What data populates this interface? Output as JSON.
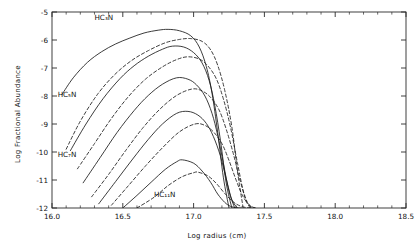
{
  "figure": {
    "xlabel": "Log radius (cm)",
    "ylabel": "Log Fractional Abundance",
    "line_color": "#1a1a1a",
    "frame_color": "#2b2b2b",
    "background": "#ffffff"
  },
  "annotations": [
    {
      "name": "label-hc3n",
      "text": "HC₃N",
      "x": 16.3,
      "y": -5.3
    },
    {
      "name": "label-hc5n",
      "text": "HC₅N",
      "x": 16.04,
      "y": -8.02
    },
    {
      "name": "label-hc7n",
      "text": "HC₇N",
      "x": 16.04,
      "y": -10.18
    },
    {
      "name": "label-hc11n",
      "text": "HC₁₁N",
      "x": 16.72,
      "y": -11.62
    }
  ],
  "chart_data": {
    "type": "line",
    "title": "",
    "xlabel": "Log radius (cm)",
    "ylabel": "Log Fractional Abundance",
    "xlim": [
      16.0,
      18.5
    ],
    "ylim": [
      -12,
      -5
    ],
    "xticks": [
      "16.0",
      "16.5",
      "17.0",
      "17.5",
      "18.0",
      "18.5"
    ],
    "yticks": [
      "-5",
      "-6",
      "-7",
      "-8",
      "-9",
      "-10",
      "-11",
      "-12"
    ],
    "xtick_values": [
      16.0,
      16.5,
      17.0,
      17.5,
      18.0,
      18.5
    ],
    "ytick_values": [
      -5,
      -6,
      -7,
      -8,
      -9,
      -10,
      -11,
      -12
    ],
    "grid": false,
    "legend": "none",
    "minor_ticks": true,
    "tick_direction": "in",
    "series": [
      {
        "name": "HC3N-solid",
        "style": "solid",
        "peak_x": 16.82,
        "peak_y": -5.62,
        "x": [
          16.07,
          16.15,
          16.25,
          16.35,
          16.45,
          16.55,
          16.65,
          16.75,
          16.82,
          16.9,
          16.98,
          17.04,
          17.09,
          17.13,
          17.17,
          17.21,
          17.25
        ],
        "y": [
          -7.95,
          -7.35,
          -6.8,
          -6.42,
          -6.14,
          -5.93,
          -5.75,
          -5.65,
          -5.62,
          -5.67,
          -5.85,
          -6.25,
          -6.95,
          -7.9,
          -9.3,
          -10.9,
          -12.0
        ]
      },
      {
        "name": "HC3N-dashed",
        "style": "dashed",
        "peak_x": 16.93,
        "peak_y": -5.95,
        "x": [
          16.1,
          16.2,
          16.32,
          16.44,
          16.56,
          16.68,
          16.8,
          16.9,
          16.98,
          17.06,
          17.12,
          17.17,
          17.22,
          17.27,
          17.31,
          17.35
        ],
        "y": [
          -9.9,
          -8.9,
          -7.95,
          -7.25,
          -6.74,
          -6.38,
          -6.1,
          -5.98,
          -5.95,
          -6.05,
          -6.35,
          -6.9,
          -7.8,
          -9.1,
          -10.7,
          -12.0
        ]
      },
      {
        "name": "HC5N-solid",
        "style": "solid",
        "peak_x": 16.85,
        "peak_y": -6.22,
        "x": [
          16.13,
          16.24,
          16.36,
          16.48,
          16.58,
          16.68,
          16.78,
          16.85,
          16.93,
          17.0,
          17.06,
          17.11,
          17.15,
          17.19,
          17.23,
          17.27
        ],
        "y": [
          -9.95,
          -9.0,
          -8.1,
          -7.38,
          -6.92,
          -6.58,
          -6.33,
          -6.22,
          -6.25,
          -6.45,
          -6.82,
          -7.45,
          -8.35,
          -9.6,
          -11.1,
          -12.0
        ]
      },
      {
        "name": "HC5N-dashed",
        "style": "dashed",
        "peak_x": 16.96,
        "peak_y": -6.6,
        "x": [
          16.18,
          16.3,
          16.42,
          16.54,
          16.66,
          16.78,
          16.88,
          16.96,
          17.04,
          17.1,
          17.16,
          17.21,
          17.26,
          17.31,
          17.36,
          17.4
        ],
        "y": [
          -10.6,
          -9.7,
          -8.8,
          -8.02,
          -7.4,
          -6.96,
          -6.7,
          -6.6,
          -6.68,
          -6.92,
          -7.38,
          -8.1,
          -9.1,
          -10.4,
          -11.6,
          -12.0
        ]
      },
      {
        "name": "HC7N-solid",
        "style": "solid",
        "peak_x": 16.88,
        "peak_y": -7.35,
        "x": [
          16.22,
          16.34,
          16.46,
          16.58,
          16.68,
          16.78,
          16.88,
          16.96,
          17.02,
          17.08,
          17.13,
          17.17,
          17.21,
          17.25,
          17.29
        ],
        "y": [
          -11.1,
          -10.2,
          -9.3,
          -8.52,
          -7.98,
          -7.58,
          -7.35,
          -7.4,
          -7.6,
          -8.0,
          -8.62,
          -9.4,
          -10.4,
          -11.4,
          -12.0
        ]
      },
      {
        "name": "HC7N-dashed",
        "style": "dashed",
        "peak_x": 16.99,
        "peak_y": -7.75,
        "x": [
          16.28,
          16.4,
          16.52,
          16.64,
          16.76,
          16.88,
          16.99,
          17.06,
          17.12,
          17.18,
          17.23,
          17.28,
          17.33,
          17.38,
          17.42
        ],
        "y": [
          -11.6,
          -10.8,
          -9.95,
          -9.15,
          -8.48,
          -7.98,
          -7.75,
          -7.82,
          -8.05,
          -8.5,
          -9.18,
          -10.05,
          -11.05,
          -11.8,
          -12.0
        ]
      },
      {
        "name": "HC9N-solid",
        "style": "solid",
        "peak_x": 16.9,
        "peak_y": -8.55,
        "x": [
          16.33,
          16.45,
          16.57,
          16.68,
          16.78,
          16.88,
          16.96,
          17.03,
          17.09,
          17.14,
          17.19,
          17.23,
          17.27,
          17.31
        ],
        "y": [
          -11.85,
          -11.05,
          -10.25,
          -9.55,
          -9.0,
          -8.62,
          -8.55,
          -8.68,
          -8.98,
          -9.45,
          -10.15,
          -10.95,
          -11.7,
          -12.0
        ]
      },
      {
        "name": "HC9N-dashed",
        "style": "dashed",
        "peak_x": 17.01,
        "peak_y": -9.0,
        "x": [
          16.42,
          16.54,
          16.66,
          16.78,
          16.9,
          17.01,
          17.08,
          17.14,
          17.2,
          17.25,
          17.3,
          17.35,
          17.4,
          17.44
        ],
        "y": [
          -11.9,
          -11.2,
          -10.5,
          -9.85,
          -9.28,
          -9.0,
          -9.05,
          -9.28,
          -9.7,
          -10.3,
          -11.0,
          -11.6,
          -11.92,
          -12.0
        ]
      },
      {
        "name": "HC11N-solid",
        "style": "solid",
        "peak_x": 16.92,
        "peak_y": -10.28,
        "x": [
          16.5,
          16.6,
          16.7,
          16.8,
          16.88,
          16.92,
          17.0,
          17.06,
          17.12,
          17.17,
          17.22,
          17.26,
          17.3,
          17.34
        ],
        "y": [
          -12.0,
          -11.55,
          -11.08,
          -10.62,
          -10.35,
          -10.28,
          -10.4,
          -10.68,
          -11.08,
          -11.5,
          -11.8,
          -11.94,
          -11.99,
          -12.0
        ]
      },
      {
        "name": "HC11N-dashed",
        "style": "dashed",
        "peak_x": 17.03,
        "peak_y": -10.72,
        "x": [
          16.6,
          16.72,
          16.82,
          16.92,
          17.0,
          17.03,
          17.1,
          17.16,
          17.22,
          17.28,
          17.33,
          17.38,
          17.43
        ],
        "y": [
          -12.0,
          -11.62,
          -11.2,
          -10.88,
          -10.74,
          -10.72,
          -10.85,
          -11.12,
          -11.48,
          -11.78,
          -11.93,
          -11.99,
          -12.0
        ]
      }
    ]
  }
}
